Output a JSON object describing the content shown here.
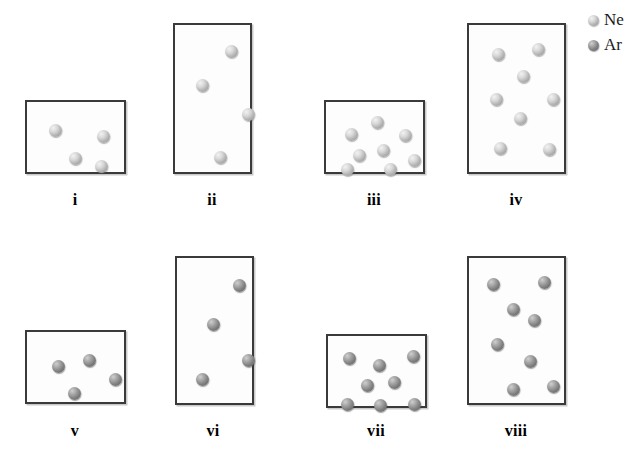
{
  "legend": {
    "title": "gas legend",
    "entries": [
      {
        "symbol": "Ne",
        "name": "neon",
        "color": "#b2b2b2"
      },
      {
        "symbol": "Ar",
        "name": "argon",
        "color": "#7f7f7f"
      }
    ]
  },
  "chart_data": {
    "type": "diagram",
    "subtype": "particle-diagram",
    "legend_position": "top-right",
    "species": [
      "Ne",
      "Ar"
    ],
    "containers": [
      {
        "label": "i",
        "gas": "Ne",
        "particle_count": 4,
        "container_shape": "wide-short",
        "box": {
          "x": 25,
          "y": 100,
          "w": 101,
          "h": 74
        },
        "label_pos": {
          "x": 75,
          "y": 192
        },
        "particles": [
          {
            "x": 22,
            "y": 22
          },
          {
            "x": 70,
            "y": 28
          },
          {
            "x": 42,
            "y": 50
          },
          {
            "x": 68,
            "y": 58
          }
        ]
      },
      {
        "label": "ii",
        "gas": "Ne",
        "particle_count": 4,
        "container_shape": "tall",
        "box": {
          "x": 173,
          "y": 23,
          "w": 79,
          "h": 151
        },
        "label_pos": {
          "x": 212,
          "y": 192
        },
        "particles": [
          {
            "x": 50,
            "y": 20
          },
          {
            "x": 21,
            "y": 54
          },
          {
            "x": 67,
            "y": 83
          },
          {
            "x": 39,
            "y": 126
          }
        ]
      },
      {
        "label": "iii",
        "gas": "Ne",
        "particle_count": 8,
        "container_shape": "wide-short",
        "box": {
          "x": 324,
          "y": 100,
          "w": 101,
          "h": 74
        },
        "label_pos": {
          "x": 374,
          "y": 192
        },
        "particles": [
          {
            "x": 45,
            "y": 14
          },
          {
            "x": 19,
            "y": 26
          },
          {
            "x": 73,
            "y": 27
          },
          {
            "x": 51,
            "y": 42
          },
          {
            "x": 27,
            "y": 47
          },
          {
            "x": 82,
            "y": 52
          },
          {
            "x": 15,
            "y": 61
          },
          {
            "x": 58,
            "y": 61
          }
        ]
      },
      {
        "label": "iv",
        "gas": "Ne",
        "particle_count": 8,
        "container_shape": "tall",
        "box": {
          "x": 467,
          "y": 23,
          "w": 99,
          "h": 151
        },
        "label_pos": {
          "x": 516,
          "y": 192
        },
        "particles": [
          {
            "x": 23,
            "y": 23
          },
          {
            "x": 63,
            "y": 18
          },
          {
            "x": 48,
            "y": 45
          },
          {
            "x": 21,
            "y": 68
          },
          {
            "x": 78,
            "y": 68
          },
          {
            "x": 45,
            "y": 87
          },
          {
            "x": 25,
            "y": 117
          },
          {
            "x": 74,
            "y": 118
          }
        ]
      },
      {
        "label": "v",
        "gas": "Ar",
        "particle_count": 4,
        "container_shape": "wide-short",
        "box": {
          "x": 25,
          "y": 330,
          "w": 101,
          "h": 74
        },
        "label_pos": {
          "x": 75,
          "y": 423
        },
        "particles": [
          {
            "x": 25,
            "y": 28
          },
          {
            "x": 56,
            "y": 22
          },
          {
            "x": 82,
            "y": 41
          },
          {
            "x": 41,
            "y": 55
          }
        ]
      },
      {
        "label": "vi",
        "gas": "Ar",
        "particle_count": 4,
        "container_shape": "tall",
        "box": {
          "x": 175,
          "y": 256,
          "w": 79,
          "h": 149
        },
        "label_pos": {
          "x": 213,
          "y": 423
        },
        "particles": [
          {
            "x": 56,
            "y": 21
          },
          {
            "x": 30,
            "y": 60
          },
          {
            "x": 65,
            "y": 96
          },
          {
            "x": 19,
            "y": 115
          }
        ]
      },
      {
        "label": "vii",
        "gas": "Ar",
        "particle_count": 8,
        "container_shape": "wide-short",
        "box": {
          "x": 326,
          "y": 334,
          "w": 101,
          "h": 74
        },
        "label_pos": {
          "x": 376,
          "y": 423
        },
        "particles": [
          {
            "x": 15,
            "y": 16
          },
          {
            "x": 45,
            "y": 23
          },
          {
            "x": 79,
            "y": 14
          },
          {
            "x": 33,
            "y": 43
          },
          {
            "x": 60,
            "y": 40
          },
          {
            "x": 13,
            "y": 62
          },
          {
            "x": 46,
            "y": 63
          },
          {
            "x": 80,
            "y": 62
          }
        ]
      },
      {
        "label": "viii",
        "gas": "Ar",
        "particle_count": 8,
        "container_shape": "tall",
        "box": {
          "x": 467,
          "y": 256,
          "w": 99,
          "h": 149
        },
        "label_pos": {
          "x": 516,
          "y": 423
        },
        "particles": [
          {
            "x": 18,
            "y": 20
          },
          {
            "x": 69,
            "y": 18
          },
          {
            "x": 38,
            "y": 45
          },
          {
            "x": 59,
            "y": 56
          },
          {
            "x": 22,
            "y": 80
          },
          {
            "x": 55,
            "y": 97
          },
          {
            "x": 38,
            "y": 125
          },
          {
            "x": 78,
            "y": 122
          }
        ]
      }
    ]
  }
}
